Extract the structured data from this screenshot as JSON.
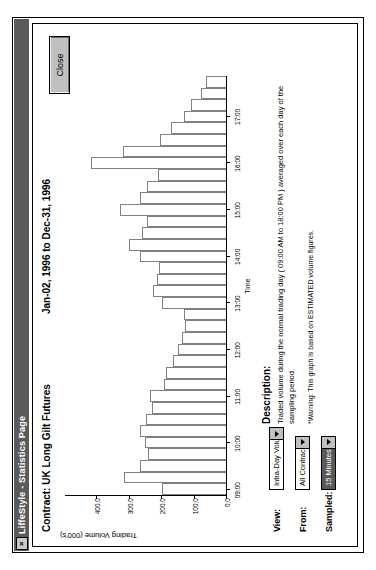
{
  "window": {
    "title": "LiffeStyle - Statistics Page",
    "system_button_glyph": "×",
    "system_button_icon": "close-icon"
  },
  "header": {
    "contract_title": "Contract: UK Long Gilt Futures",
    "date_range": "Jan-02, 1996  to  Dec-31, 1996"
  },
  "buttons": {
    "close_label": "Close"
  },
  "description": {
    "heading": "Description:",
    "body": "Traded volume during the normal trading day ( 09:00 AM to 18:00 PM ) averaged over each day of the sampling period.",
    "warning": "*Warning: This graph is based on ESTIMATED volume figures."
  },
  "controls": [
    {
      "label": "View:",
      "value": "Intra-Day Volume",
      "selected": false,
      "name": "view"
    },
    {
      "label": "From:",
      "value": "All Contracts",
      "selected": false,
      "name": "from"
    },
    {
      "label": "Sampled:",
      "value": "15 Minutes",
      "selected": true,
      "name": "sampled"
    }
  ],
  "chart_data": {
    "type": "bar",
    "orientation": "vertical",
    "title": "Contract: UK Long Gilt Futures",
    "subtitle": "Jan-02, 1996  to  Dec-31, 1996",
    "xlabel": "Time",
    "ylabel": "Trading Volume (000's)",
    "ylim": [
      0,
      500
    ],
    "yticks": [
      0,
      100,
      200,
      300,
      400
    ],
    "ytick_labels": [
      "0.0",
      "100.0",
      "200.0",
      "300.0",
      "400.0"
    ],
    "grid": false,
    "legend": "none",
    "xticks": [
      "09:00",
      "10:00",
      "11:00",
      "12:00",
      "13:00",
      "14:00",
      "15:00",
      "16:00",
      "17:00"
    ],
    "categories": [
      "09:00",
      "09:15",
      "09:30",
      "09:45",
      "10:00",
      "10:15",
      "10:30",
      "10:45",
      "11:00",
      "11:15",
      "11:30",
      "11:45",
      "12:00",
      "12:15",
      "12:30",
      "12:45",
      "13:00",
      "13:15",
      "13:30",
      "13:45",
      "14:00",
      "14:15",
      "14:30",
      "14:45",
      "15:00",
      "15:15",
      "15:30",
      "15:45",
      "16:00",
      "16:15",
      "16:30",
      "16:45",
      "17:00",
      "17:15",
      "17:30",
      "17:45"
    ],
    "values": [
      200,
      318,
      268,
      242,
      252,
      268,
      250,
      230,
      236,
      192,
      186,
      166,
      150,
      138,
      128,
      132,
      198,
      226,
      214,
      208,
      268,
      300,
      262,
      246,
      330,
      268,
      244,
      212,
      418,
      320,
      206,
      170,
      132,
      108,
      78,
      62
    ],
    "units": "thousands of contracts"
  }
}
